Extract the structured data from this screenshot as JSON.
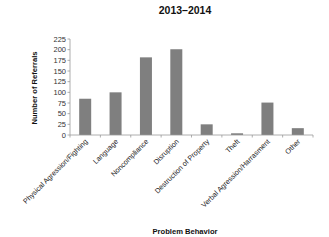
{
  "chart_data": {
    "type": "bar",
    "title": "2013–2014",
    "xlabel": "Problem Behavior",
    "ylabel": "Number of Referrals",
    "categories": [
      "Physical Agression/Fighting",
      "Language",
      "Noncompliance",
      "Disruption",
      "Destruction of Property",
      "Theft",
      "Verbal Agression/Harrasment",
      "Other"
    ],
    "values": [
      85,
      100,
      182,
      201,
      25,
      4,
      76,
      16
    ],
    "ylim": [
      0,
      225
    ],
    "yticks": [
      0,
      25,
      50,
      75,
      100,
      125,
      150,
      175,
      200,
      225
    ],
    "grid": false,
    "legend": null,
    "bar_color": "#7f7f7f",
    "axis_color": "#999999"
  }
}
